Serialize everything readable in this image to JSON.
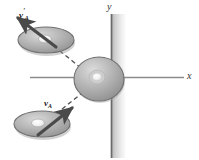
{
  "figure": {
    "background_color": "#ffffff",
    "width": 199,
    "height": 160
  },
  "axes": {
    "x_label": "x",
    "y_label": "y",
    "x_axis": {
      "x1": 30,
      "y1": 77,
      "x2": 184,
      "y2": 77,
      "color": "#8a8a8a"
    },
    "y_axis": {
      "x1": 111,
      "y1": 14,
      "x2": 111,
      "y2": 158,
      "color": "#6f6f6f"
    },
    "origin": {
      "x": 111,
      "y": 77
    }
  },
  "wall": {
    "name": "vertical-wall-band",
    "x": 111,
    "y": 14,
    "width": 14,
    "height": 144,
    "color_light": "#bdbdbd",
    "color_dark": "#f2f2f2"
  },
  "pucks": [
    {
      "id": "puck-outgoing",
      "cx": 46,
      "cy": 40,
      "rx": 28,
      "ry": 13,
      "fill": "#a8a8a8",
      "stroke": "#6b6b6b",
      "highlight": "#efefef"
    },
    {
      "id": "puck-at-wall",
      "cx": 99,
      "cy": 79,
      "rx": 25,
      "ry": 22,
      "fill": "#a3a3a3",
      "stroke": "#6b6b6b",
      "highlight": "#efefef"
    },
    {
      "id": "puck-incoming",
      "cx": 42,
      "cy": 124,
      "rx": 28,
      "ry": 13,
      "fill": "#a8a8a8",
      "stroke": "#6b6b6b",
      "highlight": "#efefef"
    }
  ],
  "vectors": [
    {
      "id": "vector-va-prime",
      "label_main": "v",
      "label_sub": "A",
      "label_prime": "′",
      "tail": {
        "x": 54,
        "y": 45
      },
      "head": {
        "x": 17,
        "y": 17
      },
      "color": "#4a4a4a",
      "description": "outgoing velocity of puck A after collision"
    },
    {
      "id": "vector-va",
      "label_main": "v",
      "label_sub": "A",
      "label_prime": "",
      "tail": {
        "x": 40,
        "y": 134
      },
      "head": {
        "x": 73,
        "y": 107
      },
      "color": "#4a4a4a",
      "description": "incoming velocity of puck A before collision"
    }
  ],
  "trajectories": [
    {
      "id": "path-incoming",
      "x1": 57,
      "y1": 113,
      "x2": 86,
      "y2": 90,
      "style": "dashed",
      "color": "#4f4f4f"
    },
    {
      "id": "path-outgoing",
      "x1": 80,
      "y1": 67,
      "x2": 57,
      "y2": 48,
      "style": "dashed",
      "color": "#4f4f4f"
    }
  ]
}
